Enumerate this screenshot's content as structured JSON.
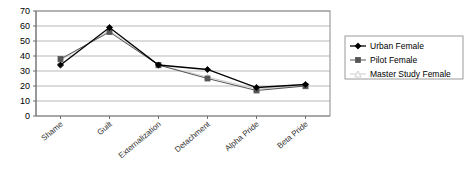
{
  "chart_data": {
    "type": "line",
    "title": "",
    "subtitle": "",
    "xlabel": "",
    "ylabel": "",
    "categories": [
      "Shame",
      "Guilt",
      "Externalization",
      "Detachment",
      "Alpha Pride",
      "Beta Pride"
    ],
    "series": [
      {
        "name": "Urban Female",
        "marker": "filled-diamond",
        "color": "#000000",
        "values": [
          34,
          59,
          34,
          31,
          19,
          21
        ]
      },
      {
        "name": "Pilot Female",
        "marker": "filled-square",
        "color": "#555555",
        "values": [
          38,
          56,
          34,
          25,
          17,
          20
        ]
      },
      {
        "name": "Master Study Female",
        "marker": "open-triangle",
        "color": "#cccccc",
        "values": [
          37,
          57,
          34,
          26,
          18,
          20
        ]
      }
    ],
    "ylim": [
      0,
      70
    ],
    "yticks": [
      0,
      10,
      20,
      30,
      40,
      50,
      60,
      70
    ],
    "grid": "horizontal",
    "legend_position": "right",
    "plot_border": true
  },
  "legend": {
    "entries": [
      {
        "label": "Urban Female"
      },
      {
        "label": "Pilot Female"
      },
      {
        "label": "Master Study Female"
      }
    ]
  }
}
